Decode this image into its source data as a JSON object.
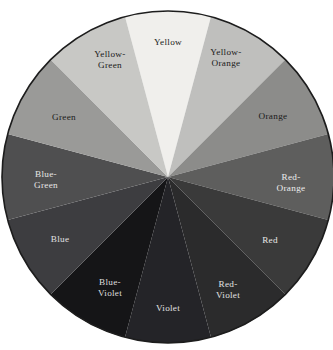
{
  "figure": {
    "kind": "color-wheel-diagram",
    "rendering": "grayscale",
    "background_color": "#ffffff",
    "border_color": "#1d1d1d",
    "center": {
      "x": 168,
      "y": 177
    },
    "radius": 166
  },
  "chart_data": {
    "type": "pie",
    "title": "",
    "subtitle": "",
    "xlabel": "",
    "ylabel": "",
    "legend_position": "inside-slices",
    "grid": false,
    "slice_count": 12,
    "slice_degrees": 30,
    "start_angle_deg": -15,
    "categories": [
      "Yellow",
      "Yellow-Orange",
      "Orange",
      "Red-Orange",
      "Red",
      "Red-Violet",
      "Violet",
      "Blue-Violet",
      "Blue",
      "Blue-Green",
      "Green",
      "Yellow-Green"
    ],
    "values": [
      30,
      30,
      30,
      30,
      30,
      30,
      30,
      30,
      30,
      30,
      30,
      30
    ],
    "slices": [
      {
        "name": "Yellow",
        "label_lines": [
          "Yellow"
        ],
        "fill": "#f0efec",
        "text_color": "#1a1a1a",
        "start_deg": -15,
        "end_deg": 15,
        "label_x": 168,
        "label_y": 43
      },
      {
        "name": "Yellow-Orange",
        "label_lines": [
          "Yellow-",
          "Orange"
        ],
        "fill": "#bfbfbd",
        "text_color": "#1a1a1a",
        "start_deg": 15,
        "end_deg": 45,
        "label_x": 226,
        "label_y": 58
      },
      {
        "name": "Orange",
        "label_lines": [
          "Orange"
        ],
        "fill": "#8c8c8a",
        "text_color": "#1a1a1a",
        "start_deg": 45,
        "end_deg": 75,
        "label_x": 273,
        "label_y": 117
      },
      {
        "name": "Red-Orange",
        "label_lines": [
          "Red-",
          "Orange"
        ],
        "fill": "#5e5e5d",
        "text_color": "#ededed",
        "start_deg": 75,
        "end_deg": 105,
        "label_x": 291,
        "label_y": 183
      },
      {
        "name": "Red",
        "label_lines": [
          "Red"
        ],
        "fill": "#3a3a3a",
        "text_color": "#e8e8e8",
        "start_deg": 105,
        "end_deg": 135,
        "label_x": 270,
        "label_y": 241
      },
      {
        "name": "Red-Violet",
        "label_lines": [
          "Red-",
          "Violet"
        ],
        "fill": "#2b2b2c",
        "text_color": "#e2e2e2",
        "start_deg": 135,
        "end_deg": 165,
        "label_x": 228,
        "label_y": 290
      },
      {
        "name": "Violet",
        "label_lines": [
          "Violet"
        ],
        "fill": "#242428",
        "text_color": "#e2e2e2",
        "start_deg": 165,
        "end_deg": 195,
        "label_x": 168,
        "label_y": 309
      },
      {
        "name": "Blue-Violet",
        "label_lines": [
          "Blue-",
          "Violet"
        ],
        "fill": "#151517",
        "text_color": "#dedede",
        "start_deg": 195,
        "end_deg": 225,
        "label_x": 110,
        "label_y": 288
      },
      {
        "name": "Blue",
        "label_lines": [
          "Blue"
        ],
        "fill": "#3d3d40",
        "text_color": "#e0e0e0",
        "start_deg": 225,
        "end_deg": 255,
        "label_x": 60,
        "label_y": 240
      },
      {
        "name": "Blue-Green",
        "label_lines": [
          "Blue-",
          "Green"
        ],
        "fill": "#4f4f50",
        "text_color": "#e6e6e6",
        "start_deg": 255,
        "end_deg": 285,
        "label_x": 46,
        "label_y": 180
      },
      {
        "name": "Green",
        "label_lines": [
          "Green"
        ],
        "fill": "#9a9a98",
        "text_color": "#1a1a1a",
        "start_deg": 285,
        "end_deg": 315,
        "label_x": 64,
        "label_y": 118
      },
      {
        "name": "Yellow-Green",
        "label_lines": [
          "Yellow-",
          "Green"
        ],
        "fill": "#c8c8c5",
        "text_color": "#1a1a1a",
        "start_deg": 315,
        "end_deg": 345,
        "label_x": 110,
        "label_y": 60
      }
    ]
  }
}
